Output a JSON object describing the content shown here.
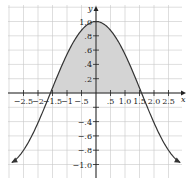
{
  "chart_data": {
    "type": "area",
    "title": "",
    "function": "y = cos(x)",
    "xlabel": "x",
    "ylabel": "y",
    "xlim": [
      -3.0,
      3.0
    ],
    "ylim": [
      -1.2,
      1.2
    ],
    "grid": true,
    "x_ticks": [
      -2.5,
      -2,
      -1.5,
      -1,
      -0.5,
      0.5,
      1.0,
      1.5,
      2.0,
      2.5
    ],
    "x_tick_labels": [
      "−2.5",
      "−2",
      "−1.5",
      "−1",
      "−.5",
      ".5",
      "1.0",
      "1.5",
      "2.0",
      "2.5"
    ],
    "y_ticks": [
      1.0,
      0.8,
      0.6,
      0.4,
      0.2,
      -0.2,
      -0.4,
      -0.6,
      -0.8,
      -1.0
    ],
    "y_tick_labels": [
      "1.0",
      ".8",
      ".6",
      ".4",
      ".2",
      "",
      "−.4",
      "−.6",
      "−.8",
      "−1.0"
    ],
    "series": [
      {
        "name": "cos(x)",
        "x": [
          -2.9,
          -2.5,
          -2.0,
          -1.5708,
          -1.0,
          -0.5,
          0,
          0.5,
          1.0,
          1.5708,
          2.0,
          2.5,
          2.9
        ],
        "values": [
          -0.97,
          -0.8,
          -0.42,
          0.0,
          0.54,
          0.88,
          1.0,
          0.88,
          0.54,
          0.0,
          -0.42,
          -0.8,
          -0.97
        ],
        "arrows_at_ends": true
      }
    ],
    "shaded_region": {
      "description": "Area under cos(x) above the x-axis",
      "x_from": -1.5708,
      "x_to": 1.5708
    },
    "colors": {
      "curve": "#333333",
      "shade": "#d4d4d4",
      "grid": "#c8c8c8",
      "axis": "#222222"
    }
  }
}
